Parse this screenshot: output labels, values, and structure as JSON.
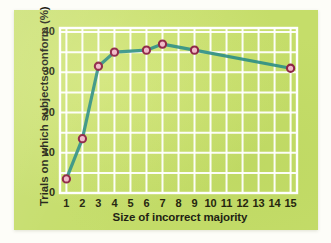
{
  "figure": {
    "background_color": "#c5dd6a",
    "page_color": "#fdfdf8"
  },
  "chart_data": {
    "type": "line",
    "title": "",
    "xlabel": "Size of incorrect majority",
    "ylabel": "Trials on which subjects conform (%)",
    "x": [
      1,
      2,
      3,
      4,
      6,
      7,
      9,
      15
    ],
    "values": [
      3.5,
      13.5,
      31.5,
      35.0,
      35.5,
      37.0,
      35.5,
      31.0
    ],
    "series": [
      {
        "name": "Conformity rate",
        "x": [
          1,
          2,
          3,
          4,
          6,
          7,
          9,
          15
        ],
        "values": [
          3.5,
          13.5,
          31.5,
          35.0,
          35.5,
          37.0,
          35.5,
          31.0
        ]
      }
    ],
    "xlim": [
      0.6,
      15.4
    ],
    "ylim": [
      0,
      41
    ],
    "xticks": [
      1,
      2,
      3,
      4,
      5,
      6,
      7,
      8,
      9,
      10,
      11,
      12,
      13,
      14,
      15
    ],
    "xticklabels": [
      "1",
      "2",
      "3",
      "4",
      "5",
      "6",
      "7",
      "8",
      "9",
      "10",
      "11",
      "12",
      "13",
      "14",
      "15"
    ],
    "yticks": [
      0,
      10,
      20,
      30,
      40
    ],
    "yticklabels": [
      "0",
      "10",
      "20",
      "30",
      "40"
    ],
    "y_gridlines": [
      0,
      5,
      10,
      15,
      20,
      25,
      30,
      35,
      40
    ],
    "x_gridlines": [
      1,
      2,
      3,
      4,
      5,
      6,
      7,
      8,
      9,
      10,
      11,
      12,
      13,
      14,
      15
    ],
    "grid": true,
    "grid_color": "#ffffff",
    "legend": false,
    "legend_position": "none",
    "line_color": "#2f8f86",
    "marker_edge_color": "#8e2545",
    "marker_face_color": "#f0b9c8",
    "marker_shape": "circle"
  }
}
